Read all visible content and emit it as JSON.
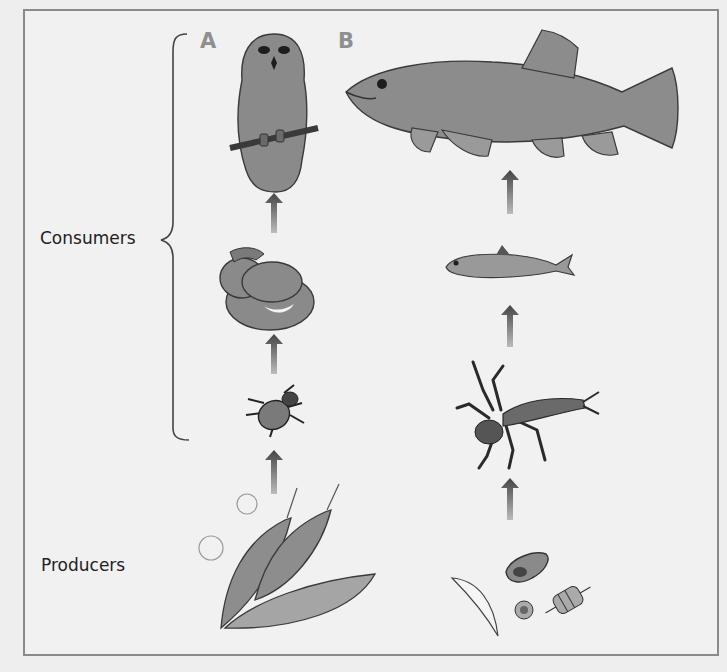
{
  "figure": {
    "type": "food-chain-diagram",
    "levels": {
      "consumers_label": "Consumers",
      "producers_label": "Producers"
    },
    "chains": [
      {
        "id": "A",
        "label": "A",
        "environment": "terrestrial",
        "organisms": [
          {
            "name": "owl",
            "role": "consumer",
            "icon": "owl-icon"
          },
          {
            "name": "snake",
            "role": "consumer",
            "icon": "snake-icon"
          },
          {
            "name": "beetle",
            "role": "consumer",
            "icon": "beetle-icon"
          },
          {
            "name": "plant leaves",
            "role": "producer",
            "icon": "leaves-icon"
          }
        ]
      },
      {
        "id": "B",
        "label": "B",
        "environment": "aquatic",
        "organisms": [
          {
            "name": "trout",
            "role": "consumer",
            "icon": "trout-icon"
          },
          {
            "name": "minnow",
            "role": "consumer",
            "icon": "small-fish-icon"
          },
          {
            "name": "aquatic insect larva",
            "role": "consumer",
            "icon": "insect-larva-icon"
          },
          {
            "name": "algae / phytoplankton",
            "role": "producer",
            "icon": "algae-icon"
          }
        ]
      }
    ],
    "arrow_direction": "upward (energy flow)",
    "colors": {
      "frame": "#8a8a8a",
      "letter": "#8f8f8f",
      "organism_fill": "#8c8c8c",
      "outline": "#3a3a3a",
      "arrow": "#555555"
    }
  }
}
